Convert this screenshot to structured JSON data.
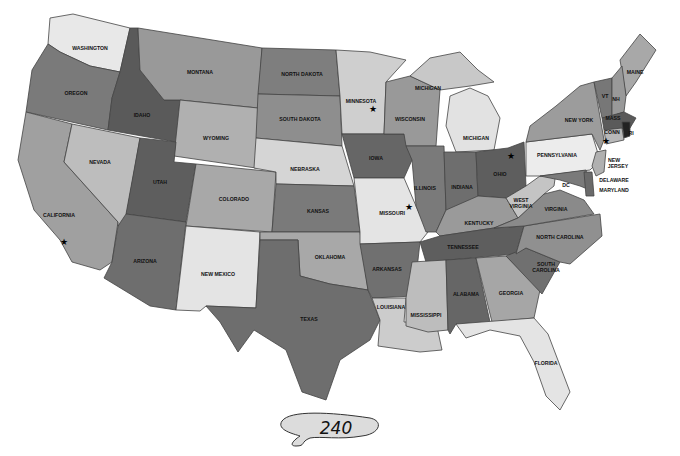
{
  "map": {
    "title": "United States",
    "states": [
      {
        "name": "WASHINGTON",
        "fill": "#e8e8e8"
      },
      {
        "name": "OREGON",
        "fill": "#7a7a7a"
      },
      {
        "name": "CALIFORNIA",
        "fill": "#a0a0a0"
      },
      {
        "name": "IDAHO",
        "fill": "#5a5a5a"
      },
      {
        "name": "NEVADA",
        "fill": "#bdbdbd"
      },
      {
        "name": "MONTANA",
        "fill": "#999999"
      },
      {
        "name": "WYOMING",
        "fill": "#b0b0b0"
      },
      {
        "name": "UTAH",
        "fill": "#5e5e5e"
      },
      {
        "name": "ARIZONA",
        "fill": "#6e6e6e"
      },
      {
        "name": "COLORADO",
        "fill": "#a8a8a8"
      },
      {
        "name": "NEW MEXICO",
        "fill": "#e4e4e4"
      },
      {
        "name": "NORTH DAKOTA",
        "fill": "#7e7e7e"
      },
      {
        "name": "SOUTH DAKOTA",
        "fill": "#8e8e8e"
      },
      {
        "name": "NEBRASKA",
        "fill": "#d5d5d5"
      },
      {
        "name": "KANSAS",
        "fill": "#7a7a7a"
      },
      {
        "name": "OKLAHOMA",
        "fill": "#a8a8a8"
      },
      {
        "name": "TEXAS",
        "fill": "#6e6e6e"
      },
      {
        "name": "MINNESOTA",
        "fill": "#cfcfcf"
      },
      {
        "name": "IOWA",
        "fill": "#666666"
      },
      {
        "name": "MISSOURI",
        "fill": "#e4e4e4"
      },
      {
        "name": "ARKANSAS",
        "fill": "#707070"
      },
      {
        "name": "LOUISIANA",
        "fill": "#cccccc"
      },
      {
        "name": "WISCONSIN",
        "fill": "#999999"
      },
      {
        "name": "ILLINOIS",
        "fill": "#7a7a7a"
      },
      {
        "name": "MICHIGAN",
        "fill": "#c8c8c8"
      },
      {
        "name": "MICHIGAN",
        "fill": "#e2e2e2"
      },
      {
        "name": "INDIANA",
        "fill": "#6e6e6e"
      },
      {
        "name": "OHIO",
        "fill": "#5e5e5e"
      },
      {
        "name": "KENTUCKY",
        "fill": "#9a9a9a"
      },
      {
        "name": "TENNESSEE",
        "fill": "#5e5e5e"
      },
      {
        "name": "MISSISSIPPI",
        "fill": "#bdbdbd"
      },
      {
        "name": "ALABAMA",
        "fill": "#666666"
      },
      {
        "name": "GEORGIA",
        "fill": "#a6a6a6"
      },
      {
        "name": "FLORIDA",
        "fill": "#e4e4e4"
      },
      {
        "name": "SOUTH CAROLINA",
        "fill": "#707070"
      },
      {
        "name": "NORTH CAROLINA",
        "fill": "#909090"
      },
      {
        "name": "VIRGINIA",
        "fill": "#8a8a8a"
      },
      {
        "name": "WEST VIRGINIA",
        "fill": "#c4c4c4"
      },
      {
        "name": "PENNSYLVANIA",
        "fill": "#ececec"
      },
      {
        "name": "NEW YORK",
        "fill": "#9c9c9c"
      },
      {
        "name": "MAINE",
        "fill": "#a8a8a8"
      },
      {
        "name": "VT",
        "fill": "#777777"
      },
      {
        "name": "NH",
        "fill": "#999999"
      },
      {
        "name": "MASS",
        "fill": "#5a5a5a"
      },
      {
        "name": "CONN",
        "fill": "#b8b8b8"
      },
      {
        "name": "RI",
        "fill": "#222222"
      },
      {
        "name": "NEW JERSEY",
        "fill": "#b0b0b0"
      },
      {
        "name": "DELAWARE",
        "fill": "#6a6a6a"
      },
      {
        "name": "MARYLAND",
        "fill": "#7a7a7a"
      },
      {
        "name": "DC",
        "fill": "#7a7a7a"
      }
    ],
    "labels": {
      "washington": "WASHINGTON",
      "oregon": "OREGON",
      "california": "CALIFORNIA",
      "idaho": "IDAHO",
      "nevada": "NEVADA",
      "montana": "MONTANA",
      "wyoming": "WYOMING",
      "utah": "UTAH",
      "arizona": "ARIZONA",
      "colorado": "COLORADO",
      "new_mexico": "NEW MEXICO",
      "north_dakota": "NORTH DAKOTA",
      "south_dakota": "SOUTH DAKOTA",
      "nebraska": "NEBRASKA",
      "kansas": "KANSAS",
      "oklahoma": "OKLAHOMA",
      "texas": "TEXAS",
      "minnesota": "MINNESOTA",
      "iowa": "IOWA",
      "missouri": "MISSOURI",
      "arkansas": "ARKANSAS",
      "louisiana": "LOUISIANA",
      "wisconsin": "WISCONSIN",
      "illinois": "ILLINOIS",
      "michigan_up": "MICHIGAN",
      "michigan_lp": "MICHIGAN",
      "indiana": "INDIANA",
      "ohio": "OHIO",
      "kentucky": "KENTUCKY",
      "tennessee": "TENNESSEE",
      "mississippi": "MISSISSIPPI",
      "alabama": "ALABAMA",
      "georgia": "GEORGIA",
      "florida": "FLORIDA",
      "south_carolina_1": "SOUTH",
      "south_carolina_2": "CAROLINA",
      "north_carolina": "NORTH CAROLINA",
      "virginia": "VIRGINIA",
      "west_virginia_1": "WEST",
      "west_virginia_2": "VIRGINIA",
      "pennsylvania": "PENNSYLVANIA",
      "new_york": "NEW YORK",
      "maine": "MAINE",
      "vt": "VT",
      "nh": "NH",
      "mass": "MASS",
      "conn": "CONN",
      "ri": "RI",
      "new_jersey_1": "NEW",
      "new_jersey_2": "JERSEY",
      "delaware": "DELAWARE",
      "maryland": "MARYLAND",
      "dc": "DC"
    },
    "capital_star": "★"
  },
  "page": {
    "number": "240"
  }
}
